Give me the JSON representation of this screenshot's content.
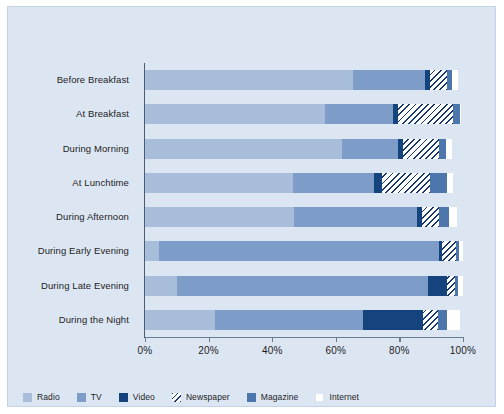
{
  "chart_data": {
    "type": "bar",
    "orientation": "horizontal",
    "stacked": true,
    "title": "",
    "subtitle": "",
    "xlabel": "",
    "ylabel": "",
    "xlim": [
      0,
      100
    ],
    "xticks": [
      0,
      20,
      40,
      60,
      80,
      100
    ],
    "xticklabels": [
      "0%",
      "20%",
      "40%",
      "60%",
      "80%",
      "100%"
    ],
    "grid": false,
    "legend_position": "bottom-left",
    "categories": [
      "Before Breakfast",
      "At Breakfast",
      "During Morning",
      "At Lunchtime",
      "During Afternoon",
      "During Early Evening",
      "During Late Evening",
      "During the Night"
    ],
    "series": [
      {
        "name": "Radio",
        "color": "#a8bdd9",
        "values": [
          65.5,
          56.5,
          62.0,
          46.5,
          47.0,
          4.5,
          10.0,
          22.0
        ]
      },
      {
        "name": "TV",
        "color": "#7e9cc8",
        "values": [
          22.5,
          21.5,
          17.5,
          25.5,
          38.5,
          88.0,
          79.0,
          46.5
        ]
      },
      {
        "name": "Video",
        "color": "#15437e",
        "values": [
          1.5,
          1.5,
          1.5,
          2.5,
          1.5,
          0.8,
          6.0,
          19.0
        ]
      },
      {
        "name": "Newspaper",
        "color": "#ffffff",
        "hatch": "diagonal-navy",
        "values": [
          5.5,
          17.5,
          11.5,
          15.0,
          5.5,
          4.5,
          2.5,
          4.5
        ]
      },
      {
        "name": "Magazine",
        "color": "#4d76ad",
        "values": [
          1.5,
          2.0,
          2.0,
          5.5,
          3.0,
          1.0,
          0.8,
          3.0
        ]
      },
      {
        "name": "Internet",
        "color": "#ffffff",
        "values": [
          2.0,
          0.5,
          2.0,
          2.0,
          2.5,
          1.2,
          1.7,
          4.0
        ]
      }
    ]
  },
  "legend": {
    "items": [
      {
        "label": "Radio",
        "swatch_class": "radio"
      },
      {
        "label": "TV",
        "swatch_class": "tv"
      },
      {
        "label": "Video",
        "swatch_class": "video"
      },
      {
        "label": "Newspaper",
        "swatch_class": "newspaper"
      },
      {
        "label": "Magazine",
        "swatch_class": "magazine"
      },
      {
        "label": "Internet",
        "swatch_class": "internet"
      }
    ]
  },
  "colors": {
    "figure_background": "#dce6f3",
    "page_background": "#ffffff",
    "axis": "#4a5b72",
    "text": "#1c1c1c"
  }
}
